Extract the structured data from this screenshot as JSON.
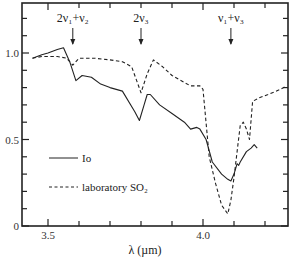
{
  "chart_data": {
    "type": "line",
    "title": "",
    "xlabel": "λ (µm)",
    "ylabel": "",
    "xlim": [
      3.42,
      4.28
    ],
    "ylim": [
      0,
      1.3
    ],
    "grid": false,
    "x_ticks": [
      3.5,
      4.0
    ],
    "x_tick_labels": [
      "3.5",
      "4.0"
    ],
    "x_minor_step": 0.1,
    "y_ticks": [
      0,
      0.5,
      1.0
    ],
    "y_tick_labels": [
      "0",
      "0.5",
      "1.0"
    ],
    "y_minor_step": 0.1,
    "legend": {
      "position": "lower-left-inside",
      "entries": [
        {
          "label": "Io",
          "style": "solid"
        },
        {
          "label": "laboratory SO₂",
          "style": "dashed"
        }
      ]
    },
    "annotations": [
      {
        "text": "2ν₁+ν₂",
        "x": 3.58,
        "arrow_to_y": 0.95
      },
      {
        "text": "2ν₃",
        "x": 3.8,
        "arrow_to_y": 0.87
      },
      {
        "text": "ν₁+ν₃",
        "x": 4.09,
        "arrow_to_y": 1.02
      }
    ],
    "series": [
      {
        "name": "Io",
        "style": "solid",
        "x": [
          3.45,
          3.48,
          3.5,
          3.53,
          3.55,
          3.57,
          3.59,
          3.61,
          3.64,
          3.67,
          3.7,
          3.74,
          3.78,
          3.795,
          3.81,
          3.82,
          3.83,
          3.86,
          3.9,
          3.94,
          3.96,
          3.98,
          3.99,
          4.01,
          4.03,
          4.06,
          4.08,
          4.09,
          4.1,
          4.11,
          4.115,
          4.12,
          4.14,
          4.155,
          4.165,
          4.175
        ],
        "values": [
          0.97,
          0.99,
          1.0,
          1.02,
          1.03,
          0.95,
          0.84,
          0.87,
          0.86,
          0.82,
          0.8,
          0.78,
          0.66,
          0.61,
          0.7,
          0.76,
          0.76,
          0.7,
          0.65,
          0.6,
          0.56,
          0.57,
          0.56,
          0.5,
          0.37,
          0.3,
          0.27,
          0.26,
          0.3,
          0.36,
          0.35,
          0.37,
          0.43,
          0.45,
          0.47,
          0.45
        ]
      },
      {
        "name": "laboratory SO₂",
        "style": "dashed",
        "x": [
          3.45,
          3.48,
          3.5,
          3.53,
          3.56,
          3.58,
          3.6,
          3.65,
          3.7,
          3.74,
          3.77,
          3.79,
          3.8,
          3.82,
          3.84,
          3.87,
          3.9,
          3.93,
          3.96,
          3.99,
          4.0,
          4.02,
          4.04,
          4.06,
          4.08,
          4.09,
          4.1,
          4.11,
          4.12,
          4.13,
          4.14,
          4.15,
          4.16,
          4.18,
          4.21,
          4.25,
          4.27
        ],
        "values": [
          0.97,
          0.98,
          0.98,
          0.98,
          0.97,
          0.93,
          0.97,
          0.97,
          0.96,
          0.95,
          0.92,
          0.82,
          0.77,
          0.88,
          0.96,
          0.92,
          0.87,
          0.84,
          0.81,
          0.81,
          0.79,
          0.4,
          0.25,
          0.12,
          0.07,
          0.15,
          0.28,
          0.43,
          0.58,
          0.6,
          0.56,
          0.5,
          0.72,
          0.74,
          0.76,
          0.79,
          0.81
        ]
      }
    ]
  }
}
